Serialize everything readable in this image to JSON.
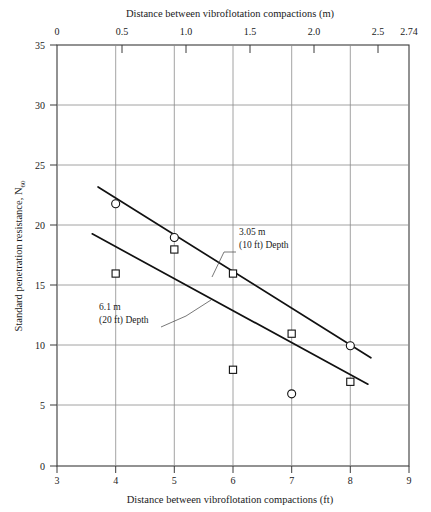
{
  "chart_data": {
    "type": "scatter",
    "title": "",
    "xlabel": "Distance between vibroflotation compactions (ft)",
    "xlabel_top": "Distance between vibroflotation compactions (m)",
    "ylabel": "Standard penetration resistance, N",
    "ylabel_sub": "60",
    "xlim": [
      3,
      9
    ],
    "ylim": [
      0,
      35
    ],
    "xlim_top_m": [
      0,
      2.74
    ],
    "grid": true,
    "legend_position": "inline-annotations",
    "x_ticks": [
      "3",
      "4",
      "5",
      "6",
      "7",
      "8",
      "9"
    ],
    "x_tick_values": [
      3,
      4,
      5,
      6,
      7,
      8,
      9
    ],
    "y_ticks": [
      "0",
      "5",
      "10",
      "15",
      "20",
      "25",
      "30",
      "35"
    ],
    "y_tick_values": [
      0,
      5,
      10,
      15,
      20,
      25,
      30,
      35
    ],
    "x_ticks_top": [
      "0",
      "0.5",
      "1.0",
      "1.5",
      "2.0",
      "2.5",
      "2.74"
    ],
    "x_tick_values_top_m": [
      0,
      0.5,
      1.0,
      1.5,
      2.0,
      2.5,
      2.74
    ],
    "series": [
      {
        "name": "3.05 m (10 ft) Depth",
        "marker": "circle",
        "x": [
          4,
          5,
          7,
          8
        ],
        "values": [
          21.8,
          19.0,
          6.0,
          10.0
        ],
        "trend_x": [
          3.7,
          8.35
        ],
        "trend_y": [
          23.2,
          9.0
        ]
      },
      {
        "name": "6.1 m (20 ft) Depth",
        "marker": "square",
        "x": [
          4,
          5,
          6,
          6,
          7,
          8
        ],
        "values": [
          16.0,
          18.0,
          16.0,
          8.0,
          11.0,
          7.0
        ],
        "trend_x": [
          3.6,
          8.3
        ],
        "trend_y": [
          19.3,
          6.8
        ]
      }
    ],
    "annotations": [
      {
        "id": "annot-depth-10ft",
        "line1": "3.05 m",
        "line2": "(10 ft) Depth",
        "x_text": 6.05,
        "y_text": 18.4
      },
      {
        "id": "annot-depth-20ft",
        "line1": "6.1 m",
        "line2": "(20 ft) Depth",
        "x_text": 4.1,
        "y_text": 13.1
      }
    ],
    "colors": {
      "axis": "#3a3a3a",
      "grid": "#8c8c8c",
      "line": "#111111",
      "marker_fill": "#ffffff",
      "text": "#1a1a1a",
      "background": "#ffffff"
    }
  }
}
